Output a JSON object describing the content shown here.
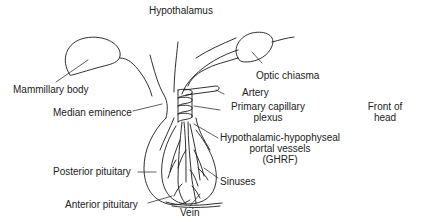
{
  "diagram": {
    "type": "anatomical-illustration",
    "line_color": "#1a1a1a",
    "background": "#ffffff",
    "labels": {
      "hypothalamus": "Hypothalamus",
      "mammillary_body": "Mammillary body",
      "optic_chiasma": "Optic chiasma",
      "artery": "Artery",
      "median_eminence": "Median eminence",
      "primary_capillary_plexus_line1": "Primary capillary",
      "primary_capillary_plexus_line2": "plexus",
      "front_of_head_line1": "Front of",
      "front_of_head_line2": "head",
      "portal_vessels_line1": "Hypothalamic-hypophyseal",
      "portal_vessels_line2": "portal vessels",
      "portal_vessels_line3": "(GHRF)",
      "sinuses": "Sinuses",
      "posterior_pituitary": "Posterior pituitary",
      "anterior_pituitary": "Anterior pituitary",
      "vein": "Vein"
    }
  }
}
